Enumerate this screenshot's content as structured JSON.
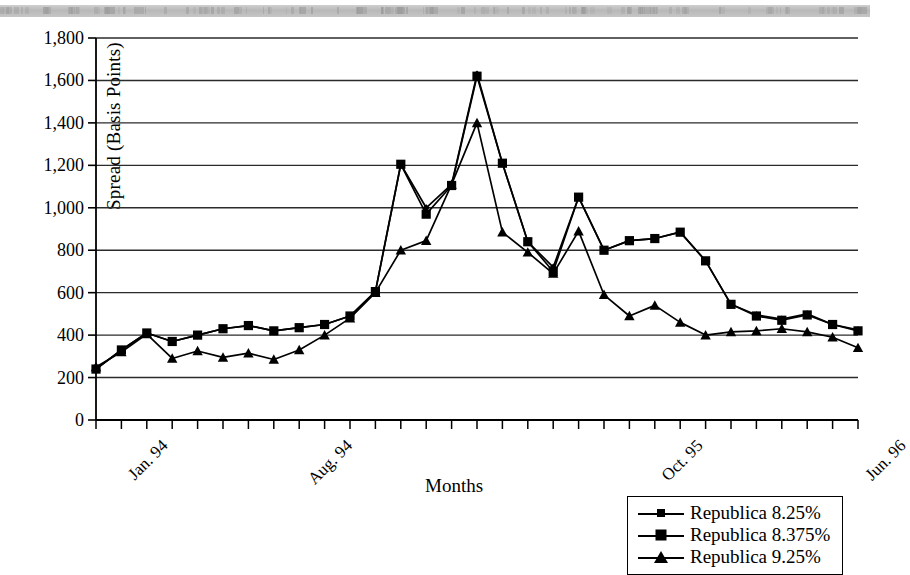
{
  "chart_data": {
    "type": "line",
    "title": "",
    "xlabel": "Months",
    "ylabel": "Spread (Basis Points)",
    "ylim": [
      0,
      1800
    ],
    "ytick_values": [
      0,
      200,
      400,
      600,
      800,
      1000,
      1200,
      1400,
      1600,
      1800
    ],
    "ytick_labels": [
      "0",
      "200",
      "400",
      "600",
      "800",
      "1,000",
      "1,200",
      "1,400",
      "1,600",
      "1,800"
    ],
    "grid": "horizontal",
    "legend_position": "bottom-right",
    "x_count": 31,
    "xtick_labels": [
      {
        "index": 0,
        "label": "Jan. 94"
      },
      {
        "index": 7,
        "label": "Aug. 94"
      },
      {
        "index": 21,
        "label": "Oct. 95"
      },
      {
        "index": 29,
        "label": "Jun. 96"
      }
    ],
    "series": [
      {
        "name": "Republica 8.25%",
        "marker": "diamond",
        "values": [
          240,
          330,
          410,
          370,
          400,
          430,
          445,
          420,
          435,
          450,
          490,
          605,
          1205,
          1000,
          1110,
          1630,
          1210,
          840,
          720,
          1050,
          800,
          845,
          855,
          885,
          750,
          545,
          495,
          475,
          500,
          450,
          425
        ]
      },
      {
        "name": "Republica 8.375%",
        "marker": "square",
        "values": [
          240,
          330,
          410,
          370,
          400,
          430,
          445,
          420,
          435,
          450,
          490,
          605,
          1205,
          970,
          1105,
          1620,
          1210,
          840,
          700,
          1050,
          800,
          845,
          855,
          885,
          750,
          545,
          490,
          470,
          495,
          450,
          420
        ]
      },
      {
        "name": "Republica 9.25%",
        "marker": "triangle",
        "values": [
          250,
          320,
          405,
          290,
          325,
          295,
          315,
          285,
          330,
          400,
          480,
          600,
          800,
          845,
          1110,
          1400,
          885,
          790,
          690,
          890,
          590,
          490,
          540,
          460,
          400,
          415,
          420,
          430,
          415,
          390,
          340
        ]
      }
    ]
  },
  "legend": {
    "items": [
      {
        "label": "Republica 8.25%",
        "marker": "diamond"
      },
      {
        "label": "Republica 8.375%",
        "marker": "square"
      },
      {
        "label": "Republica 9.25%",
        "marker": "triangle"
      }
    ]
  }
}
